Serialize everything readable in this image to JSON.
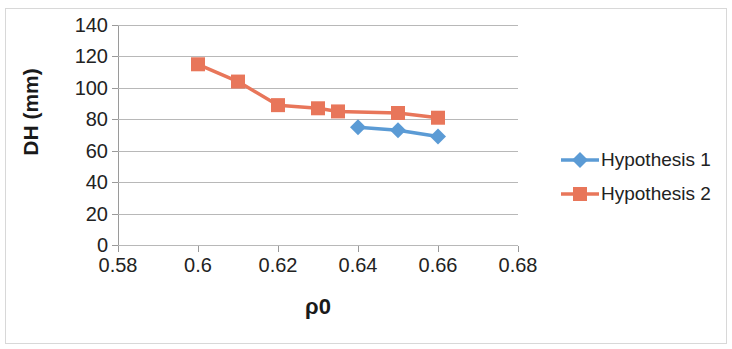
{
  "chart_data": {
    "type": "line",
    "title": "",
    "xlabel": "ρ0",
    "ylabel": "DH (mm)",
    "xlim": [
      0.58,
      0.68
    ],
    "ylim": [
      0,
      140
    ],
    "xticks": [
      "0.58",
      "0.6",
      "0.62",
      "0.64",
      "0.66",
      "0.68"
    ],
    "xtick_values": [
      0.58,
      0.6,
      0.62,
      0.64,
      0.66,
      0.68
    ],
    "yticks": [
      "0",
      "20",
      "40",
      "60",
      "80",
      "100",
      "120",
      "140"
    ],
    "ytick_values": [
      0,
      20,
      40,
      60,
      80,
      100,
      120,
      140
    ],
    "grid": "horizontal",
    "legend_position": "right",
    "series": [
      {
        "name": "Hypothesis 1",
        "color": "#5B9BD5",
        "marker": "diamond",
        "x": [
          0.64,
          0.65,
          0.66
        ],
        "values": [
          75,
          73,
          69
        ]
      },
      {
        "name": "Hypothesis 2",
        "color": "#E8765A",
        "marker": "square",
        "x": [
          0.6,
          0.61,
          0.62,
          0.63,
          0.635,
          0.65,
          0.66
        ],
        "values": [
          115,
          104,
          89,
          87,
          85,
          84,
          81
        ]
      }
    ]
  },
  "legend": {
    "items": [
      {
        "label": "Hypothesis 1"
      },
      {
        "label": "Hypothesis 2"
      }
    ]
  }
}
